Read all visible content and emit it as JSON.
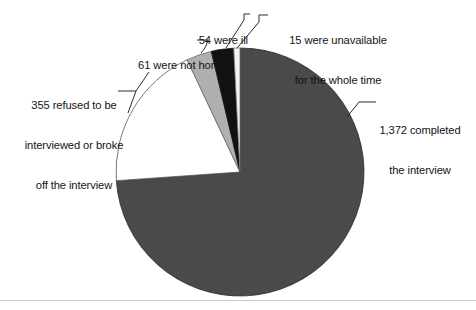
{
  "figure": {
    "title": "",
    "background": "#ffffff",
    "rule_color": "#c9c9c9"
  },
  "chart_data": {
    "type": "pie",
    "title": "",
    "xlabel": "",
    "ylabel": "",
    "total": 1857,
    "legend_position": "none",
    "grid": false,
    "categories": [
      "1,372 completed the interview",
      "355 refused to be interviewed or broke off the interview",
      "61 were not home",
      "54 were ill",
      "15 were unavailable for the whole time"
    ],
    "values": [
      1372,
      355,
      61,
      54,
      15
    ],
    "colors": [
      "#4a4a4a",
      "#ffffff",
      "#b0b0b0",
      "#111111",
      "#f2f2f2"
    ],
    "slices": [
      {
        "name": "completed",
        "value": 1372,
        "color": "#4a4a4a",
        "start_angle": 0,
        "end_angle": 266.06,
        "label_lines": [
          "1,372 completed",
          "the interview"
        ]
      },
      {
        "name": "refused",
        "value": 355,
        "color": "#ffffff",
        "start_angle": 266.06,
        "end_angle": 334.89,
        "label_lines": [
          "355 refused to be",
          "interviewed or broke",
          "off the interview"
        ]
      },
      {
        "name": "not-home",
        "value": 61,
        "color": "#b0b0b0",
        "start_angle": 334.89,
        "end_angle": 346.72,
        "label_lines": [
          "61 were not home"
        ]
      },
      {
        "name": "ill",
        "value": 54,
        "color": "#111111",
        "start_angle": 346.72,
        "end_angle": 357.19,
        "label_lines": [
          "54 were ill"
        ]
      },
      {
        "name": "unavailable",
        "value": 15,
        "color": "#f2f2f2",
        "start_angle": 357.19,
        "end_angle": 360,
        "label_lines": [
          "15 were unavailable",
          "for the whole time"
        ]
      }
    ]
  },
  "labels": {
    "completed": {
      "line1": "1,372 completed",
      "line2": "the interview"
    },
    "unavailable": {
      "line1": "15 were unavailable",
      "line2": "for the whole time"
    },
    "ill": {
      "line1": "54 were ill"
    },
    "not_home": {
      "line1": "61 were not home"
    },
    "refused": {
      "line1": "355 refused to be",
      "line2": "interviewed or broke",
      "line3": "off the interview"
    }
  }
}
